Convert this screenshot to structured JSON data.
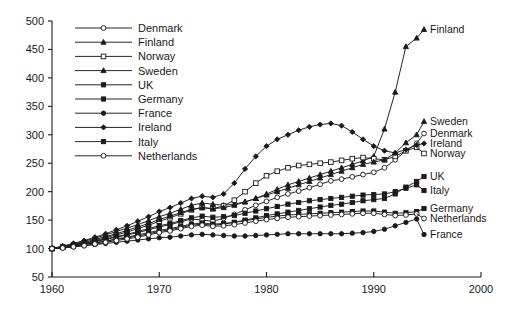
{
  "chart_data": {
    "type": "line",
    "title": "",
    "xlabel": "",
    "ylabel": "",
    "xlim": [
      1960,
      2000
    ],
    "ylim": [
      50,
      500
    ],
    "xticks": [
      1960,
      1970,
      1980,
      1990,
      2000
    ],
    "yticks": [
      50,
      100,
      150,
      200,
      250,
      300,
      350,
      400,
      450,
      500
    ],
    "grid": false,
    "legend_position": "top-left-inside",
    "end_labels_position": "right-outside",
    "x": [
      1960,
      1961,
      1962,
      1963,
      1964,
      1965,
      1966,
      1967,
      1968,
      1969,
      1970,
      1971,
      1972,
      1973,
      1974,
      1975,
      1976,
      1977,
      1978,
      1979,
      1980,
      1981,
      1982,
      1983,
      1984,
      1985,
      1986,
      1987,
      1988,
      1989,
      1990,
      1991,
      1992,
      1993,
      1994
    ],
    "series": [
      {
        "name": "Denmark",
        "marker": "open-circle",
        "end_label": "Denmark",
        "values": [
          100,
          102,
          105,
          108,
          112,
          116,
          120,
          124,
          128,
          133,
          138,
          142,
          147,
          152,
          150,
          148,
          153,
          160,
          168,
          176,
          183,
          190,
          196,
          201,
          207,
          213,
          219,
          222,
          226,
          230,
          234,
          242,
          256,
          272,
          285
        ]
      },
      {
        "name": "Finland",
        "marker": "filled-triangle",
        "end_label": "Finland",
        "values": [
          100,
          104,
          108,
          113,
          118,
          124,
          130,
          136,
          142,
          149,
          156,
          162,
          169,
          176,
          180,
          178,
          176,
          178,
          182,
          188,
          196,
          204,
          212,
          218,
          224,
          230,
          236,
          242,
          248,
          254,
          262,
          310,
          375,
          455,
          470
        ]
      },
      {
        "name": "Norway",
        "marker": "open-square",
        "end_label": "Norway",
        "values": [
          100,
          103,
          106,
          110,
          114,
          119,
          124,
          129,
          135,
          141,
          148,
          154,
          161,
          168,
          172,
          170,
          175,
          185,
          200,
          215,
          228,
          236,
          242,
          246,
          248,
          250,
          252,
          255,
          258,
          260,
          258,
          256,
          262,
          272,
          278
        ]
      },
      {
        "name": "Sweden",
        "marker": "filled-triangle",
        "end_label": "Sweden",
        "values": [
          100,
          103,
          107,
          111,
          116,
          121,
          126,
          132,
          138,
          144,
          151,
          157,
          163,
          169,
          172,
          170,
          172,
          176,
          182,
          188,
          194,
          200,
          206,
          212,
          218,
          224,
          230,
          236,
          242,
          248,
          252,
          256,
          268,
          286,
          300
        ]
      },
      {
        "name": "UK",
        "marker": "filled-square",
        "end_label": "UK",
        "values": [
          100,
          102,
          104,
          107,
          110,
          113,
          116,
          119,
          122,
          126,
          130,
          133,
          137,
          141,
          143,
          141,
          143,
          146,
          150,
          154,
          158,
          161,
          164,
          167,
          170,
          173,
          176,
          178,
          181,
          184,
          186,
          188,
          196,
          208,
          218
        ]
      },
      {
        "name": "Germany",
        "marker": "filled-square",
        "end_label": "Germany",
        "values": [
          100,
          102,
          104,
          107,
          110,
          113,
          117,
          120,
          124,
          128,
          132,
          135,
          139,
          143,
          145,
          143,
          144,
          146,
          149,
          152,
          155,
          157,
          159,
          160,
          161,
          162,
          163,
          164,
          165,
          166,
          166,
          164,
          162,
          163,
          165
        ]
      },
      {
        "name": "France",
        "marker": "filled-circle",
        "end_label": "France",
        "values": [
          100,
          101,
          103,
          105,
          107,
          109,
          111,
          113,
          115,
          117,
          119,
          120,
          122,
          124,
          125,
          124,
          123,
          122,
          122,
          123,
          124,
          125,
          126,
          126,
          126,
          126,
          126,
          126,
          127,
          128,
          130,
          134,
          140,
          146,
          152
        ]
      },
      {
        "name": "Ireland",
        "marker": "filled-diamond",
        "end_label": "Ireland",
        "values": [
          100,
          104,
          109,
          114,
          120,
          126,
          133,
          140,
          148,
          156,
          165,
          172,
          180,
          188,
          192,
          190,
          196,
          215,
          240,
          262,
          280,
          292,
          300,
          308,
          314,
          318,
          320,
          316,
          305,
          292,
          280,
          272,
          268,
          274,
          282
        ]
      },
      {
        "name": "Italy",
        "marker": "filled-square",
        "end_label": "Italy",
        "values": [
          100,
          103,
          106,
          109,
          113,
          117,
          121,
          125,
          130,
          135,
          140,
          144,
          149,
          154,
          157,
          155,
          156,
          158,
          162,
          166,
          170,
          174,
          178,
          181,
          184,
          186,
          188,
          190,
          192,
          194,
          195,
          196,
          200,
          206,
          212
        ]
      },
      {
        "name": "Netherlands",
        "marker": "open-circle",
        "end_label": "Netherlands",
        "values": [
          100,
          101,
          103,
          105,
          108,
          111,
          114,
          117,
          120,
          124,
          128,
          131,
          135,
          139,
          141,
          139,
          140,
          142,
          145,
          148,
          151,
          153,
          155,
          156,
          157,
          158,
          159,
          160,
          161,
          162,
          162,
          160,
          158,
          159,
          161
        ]
      }
    ]
  },
  "legend": {
    "items": [
      {
        "label": "Denmark"
      },
      {
        "label": "Finland"
      },
      {
        "label": "Norway"
      },
      {
        "label": "Sweden"
      },
      {
        "label": "UK"
      },
      {
        "label": "Germany"
      },
      {
        "label": "France"
      },
      {
        "label": "Ireland"
      },
      {
        "label": "Italy"
      },
      {
        "label": "Netherlands"
      }
    ]
  },
  "axes": {
    "y_tick_labels": [
      "500",
      "450",
      "400",
      "350",
      "300",
      "250",
      "200",
      "150",
      "100",
      "50"
    ],
    "x_tick_labels": [
      "1960",
      "1970",
      "1980",
      "1990",
      "2000"
    ]
  },
  "colors": {
    "line": "#1a1a1a",
    "text": "#1a1a1a",
    "background": "#ffffff"
  }
}
